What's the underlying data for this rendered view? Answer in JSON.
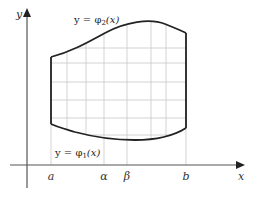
{
  "diagram": {
    "title": "",
    "axes": {
      "x_label": "x",
      "y_label": "y"
    },
    "curves": {
      "upper": {
        "label": "y = φ₂(x)",
        "label_display": "y = φ",
        "sub": "2",
        "arg": "(x)"
      },
      "lower": {
        "label": "y = φ₁(x)",
        "label_display": "y = φ",
        "sub": "1",
        "arg": "(x)"
      }
    },
    "x_ticks": [
      {
        "label": "a",
        "x": 51
      },
      {
        "label": "α",
        "x": 104
      },
      {
        "label": "β",
        "x": 127
      },
      {
        "label": "b",
        "x": 186
      }
    ],
    "grid": {
      "vertical_x": [
        67,
        86,
        104,
        127,
        151,
        166
      ],
      "horizontal_y": [
        48,
        63,
        82,
        100,
        118,
        135
      ]
    },
    "colors": {
      "axis": "#555555",
      "curve": "#222222",
      "grid": "#c8c8c8"
    }
  }
}
